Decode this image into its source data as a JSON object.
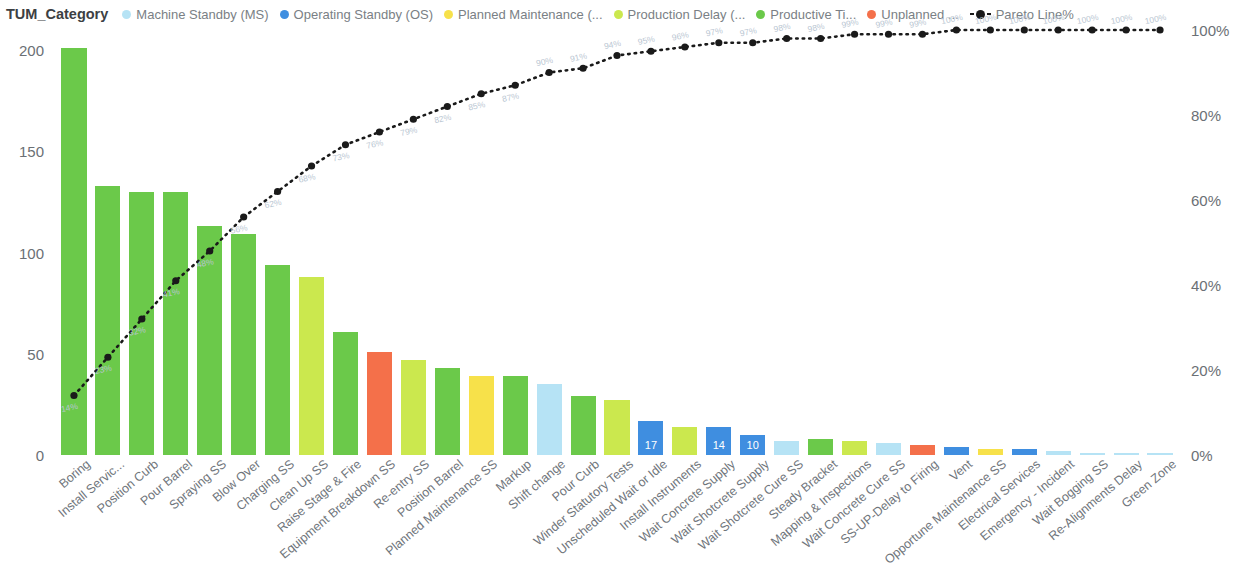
{
  "legend": {
    "title": "TUM_Category",
    "items": [
      {
        "label": "Machine Standby (MS)",
        "color": "#b6e3f5",
        "marker": "dot"
      },
      {
        "label": "Operating Standby (OS)",
        "color": "#3f8ee0",
        "marker": "dot"
      },
      {
        "label": "Planned Maintenance (...",
        "color": "#f7e14a",
        "marker": "dot"
      },
      {
        "label": "Production Delay (...",
        "color": "#cbe84e",
        "marker": "dot"
      },
      {
        "label": "Productive Ti...",
        "color": "#6bc94a",
        "marker": "dot"
      },
      {
        "label": "Unplanned ...",
        "color": "#f4704a",
        "marker": "dot"
      },
      {
        "label": "Pareto Line%",
        "color": "#1a1a1a",
        "marker": "dashed-line"
      }
    ]
  },
  "axes": {
    "left_ticks": [
      "200",
      "150",
      "100",
      "50",
      "0"
    ],
    "left_values": [
      200,
      150,
      100,
      50,
      0
    ],
    "right_ticks": [
      "100%",
      "80%",
      "60%",
      "40%",
      "20%",
      "0%"
    ],
    "right_values": [
      100,
      80,
      60,
      40,
      20,
      0
    ]
  },
  "chart_data": {
    "type": "bar",
    "title": "",
    "xlabel": "",
    "ylabel": "",
    "ylim": [
      0,
      210
    ],
    "y2lim": [
      0,
      100
    ],
    "grid": false,
    "legend_position": "top",
    "categories": [
      "Boring",
      "Install Servic...",
      "Position Curb",
      "Pour Barrel",
      "Spraying SS",
      "Blow Over",
      "Charging SS",
      "Clean Up SS",
      "Raise Stage & Fire",
      "Equipment Breakdown SS",
      "Re-entry SS",
      "Position Barrel",
      "Planned Maintenance SS",
      "Markup",
      "Shift change",
      "Pour Curb",
      "Winder Statutory Tests",
      "Unscheduled Wait or Idle",
      "Install Instruments",
      "Wait Concrete Supply",
      "Wait Shotcrete Supply",
      "Wait Shotcrete Cure SS",
      "Steady Bracket",
      "Mapping & Inspections",
      "Wait Concrete Cure SS",
      "SS-UP-Delay to Firing",
      "Vent",
      "Opportune Maintenance SS",
      "Electrical Services",
      "Emergency - Incident",
      "Wait Bogging SS",
      "Re-Alignments Delay",
      "Green Zone"
    ],
    "values": [
      201,
      133,
      130,
      130,
      113,
      109,
      94,
      88,
      61,
      51,
      47,
      43,
      39,
      39,
      35,
      29,
      27,
      17,
      14,
      14,
      10,
      7,
      8,
      7,
      6,
      5,
      4,
      3,
      3,
      2,
      1,
      1,
      1
    ],
    "bar_colors": [
      "#6bc94a",
      "#6bc94a",
      "#6bc94a",
      "#6bc94a",
      "#6bc94a",
      "#6bc94a",
      "#6bc94a",
      "#cbe84e",
      "#6bc94a",
      "#f4704a",
      "#cbe84e",
      "#6bc94a",
      "#f7e14a",
      "#6bc94a",
      "#b6e3f5",
      "#6bc94a",
      "#cbe84e",
      "#3f8ee0",
      "#cbe84e",
      "#3f8ee0",
      "#3f8ee0",
      "#b6e3f5",
      "#6bc94a",
      "#cbe84e",
      "#b6e3f5",
      "#f4704a",
      "#3f8ee0",
      "#f7e14a",
      "#3f8ee0",
      "#b6e3f5",
      "#b6e3f5",
      "#b6e3f5",
      "#b6e3f5"
    ],
    "bar_value_labels": [
      "",
      "",
      "",
      "",
      "",
      "",
      "",
      "",
      "",
      "",
      "",
      "",
      "",
      "",
      "",
      "",
      "",
      "17",
      "",
      "14",
      "10",
      "",
      "",
      "",
      "",
      "",
      "",
      "",
      "",
      "",
      "",
      "",
      ""
    ],
    "series": [
      {
        "name": "Pareto Line%",
        "type": "line",
        "axis": "right",
        "color": "#1a1a1a",
        "values": [
          14,
          23,
          32,
          41,
          48,
          56,
          62,
          68,
          73,
          76,
          79,
          82,
          85,
          87,
          90,
          91,
          94,
          95,
          96,
          97,
          97,
          98,
          98,
          99,
          99,
          99,
          100,
          100,
          100,
          100,
          100,
          100,
          100
        ],
        "labels": [
          "14%",
          "23%",
          "32%",
          "41%",
          "48%",
          "56%",
          "62%",
          "68%",
          "73%",
          "76%",
          "79%",
          "82%",
          "85%",
          "87%",
          "90%",
          "91%",
          "94%",
          "95%",
          "96%",
          "97%",
          "97%",
          "98%",
          "98%",
          "99%",
          "99%",
          "99%",
          "100%",
          "100%",
          "100%",
          "100%",
          "100%",
          "100%",
          "100%"
        ]
      }
    ]
  }
}
